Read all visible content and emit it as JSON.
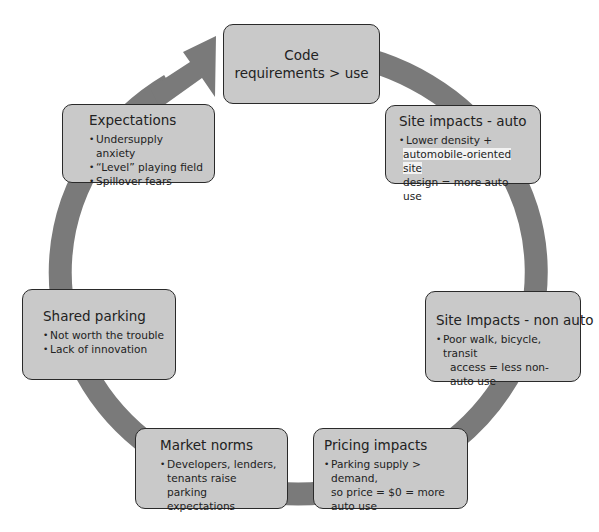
{
  "diagram": {
    "type": "cycle",
    "ring_color": "#7a7a7a",
    "box_fill": "#c9c9c9",
    "box_border": "#2a2a2a",
    "nodes": [
      {
        "id": "code",
        "title_lines": [
          "Code",
          "requirements > use"
        ]
      },
      {
        "id": "site-auto",
        "title": "Site impacts - auto",
        "bullets": [
          "Lower density +",
          "automobile-oriented site",
          "design = more auto use"
        ]
      },
      {
        "id": "site-non-auto",
        "title": "Site Impacts - non auto",
        "bullets": [
          "Poor walk, bicycle, transit",
          "access = less non-auto use"
        ]
      },
      {
        "id": "pricing",
        "title": "Pricing impacts",
        "bullets": [
          "Parking supply > demand,",
          "so price = $0 = more",
          "auto use"
        ]
      },
      {
        "id": "market",
        "title": "Market norms",
        "bullets": [
          "Developers, lenders,",
          "tenants raise parking",
          "expectations"
        ]
      },
      {
        "id": "shared",
        "title": "Shared parking",
        "bullets": [
          "Not worth the trouble",
          "Lack of innovation"
        ]
      },
      {
        "id": "expectations",
        "title": "Expectations",
        "bullets": [
          "Undersupply anxiety",
          "“Level” playing field",
          "Spillover fears"
        ]
      }
    ],
    "arrow": {
      "direction": "clockwise",
      "head_near": "code"
    }
  }
}
